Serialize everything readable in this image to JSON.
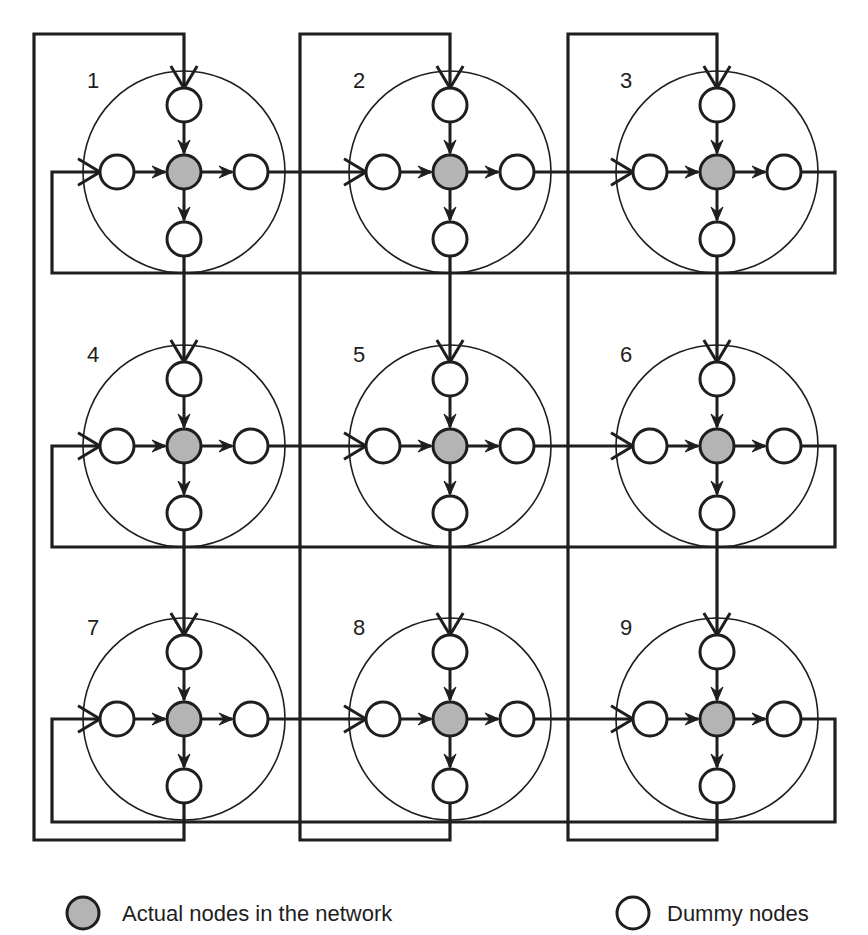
{
  "diagram": {
    "type": "torus-network-with-dummy-nodes",
    "grid": {
      "rows": 3,
      "cols": 3
    },
    "colors": {
      "line": "#1e1e1e",
      "actual_node_fill": "#b4b4b4",
      "dummy_node_fill": "#ffffff",
      "background": "#ffffff"
    },
    "nodes": [
      {
        "id": 1,
        "label": "1",
        "row": 0,
        "col": 0
      },
      {
        "id": 2,
        "label": "2",
        "row": 0,
        "col": 1
      },
      {
        "id": 3,
        "label": "3",
        "row": 0,
        "col": 2
      },
      {
        "id": 4,
        "label": "4",
        "row": 1,
        "col": 0
      },
      {
        "id": 5,
        "label": "5",
        "row": 1,
        "col": 1
      },
      {
        "id": 6,
        "label": "6",
        "row": 1,
        "col": 2
      },
      {
        "id": 7,
        "label": "7",
        "row": 2,
        "col": 0
      },
      {
        "id": 8,
        "label": "8",
        "row": 2,
        "col": 1
      },
      {
        "id": 9,
        "label": "9",
        "row": 2,
        "col": 2
      }
    ],
    "cluster_structure": {
      "center": "actual node",
      "satellites": [
        "top dummy (in)",
        "left dummy (in)",
        "right dummy (out)",
        "bottom dummy (out)"
      ],
      "internal_edges": [
        "top -> center",
        "left -> center",
        "center -> right",
        "center -> bottom"
      ]
    },
    "edges": {
      "horizontal": [
        "1->2",
        "2->3",
        "3->1 (wrap)",
        "4->5",
        "5->6",
        "6->4 (wrap)",
        "7->8",
        "8->9",
        "9->7 (wrap)"
      ],
      "vertical": [
        "1->4",
        "4->7",
        "7->1 (wrap)",
        "2->5",
        "5->8",
        "8->2 (wrap)",
        "3->6",
        "6->9",
        "9->3 (wrap)"
      ]
    }
  },
  "legend": {
    "actual": {
      "icon": "filled-gray-circle",
      "label": "Actual nodes in the network"
    },
    "dummy": {
      "icon": "hollow-circle",
      "label": "Dummy nodes"
    }
  }
}
